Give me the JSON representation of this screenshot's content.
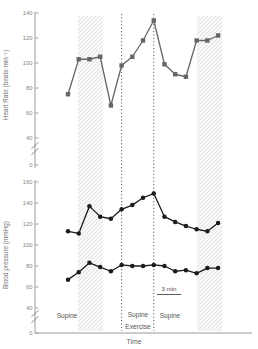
{
  "figure": {
    "xlabel": "Time",
    "scalebar": {
      "label": "3 min"
    },
    "phase_labels": [
      {
        "name": "phase-supine-1",
        "lines": [
          "Supine"
        ]
      },
      {
        "name": "phase-supine-exercise",
        "lines": [
          "Supine",
          "Exercise"
        ]
      },
      {
        "name": "phase-supine-2",
        "lines": [
          "Supine"
        ]
      }
    ],
    "colors": {
      "heart_rate": "#666666",
      "blood_pressure": "#1c1c1c",
      "axis": "#9a9a9a",
      "hatch_line": "#e3e3e3",
      "hatch_fill": "#fcfcfc",
      "dotted_line": "#4a4a4a"
    }
  },
  "chart_data": [
    {
      "type": "line",
      "title": "",
      "ylabel": "Heart Rate (beats·min⁻¹)",
      "xlabel": "Time",
      "x": [
        1,
        2,
        3,
        4,
        5,
        6,
        7,
        8,
        9,
        10,
        11,
        12,
        13,
        14,
        15
      ],
      "series": [
        {
          "name": "heart-rate",
          "marker": "square",
          "color": "#666666",
          "values": [
            75,
            103,
            103,
            105,
            66,
            98,
            105,
            118,
            134,
            99,
            91,
            89,
            118,
            118,
            122
          ]
        }
      ],
      "yticks": [
        140,
        120,
        100,
        80,
        60,
        40
      ],
      "zero_tick": 0,
      "axis_break": true,
      "ylim": [
        40,
        140
      ],
      "grid": false,
      "dotted_marker_x": [
        6,
        9
      ],
      "shaded_bands_x": [
        [
          1.93,
          4.27
        ],
        [
          13.03,
          15.37
        ]
      ]
    },
    {
      "type": "line",
      "title": "",
      "ylabel": "Blood pressure (mmHg)",
      "xlabel": "Time",
      "x": [
        1,
        2,
        3,
        4,
        5,
        6,
        7,
        8,
        9,
        10,
        11,
        12,
        13,
        14,
        15
      ],
      "series": [
        {
          "name": "systolic-pressure",
          "marker": "circle",
          "color": "#1c1c1c",
          "values": [
            113,
            111,
            137,
            127,
            125,
            134,
            138,
            145,
            149,
            127,
            122,
            118,
            115,
            113,
            121
          ]
        },
        {
          "name": "diastolic-pressure",
          "marker": "circle",
          "color": "#1c1c1c",
          "values": [
            67,
            74,
            83,
            79,
            75,
            81,
            80,
            80,
            81,
            80,
            75,
            76,
            73,
            78,
            78
          ]
        }
      ],
      "yticks": [
        160,
        140,
        120,
        100,
        80,
        60,
        40
      ],
      "zero_tick": 0,
      "axis_break": true,
      "ylim": [
        40,
        160
      ],
      "grid": false,
      "dotted_marker_x": [
        6,
        9
      ],
      "shaded_bands_x": [
        [
          1.93,
          4.27
        ],
        [
          13.03,
          15.37
        ]
      ]
    }
  ]
}
